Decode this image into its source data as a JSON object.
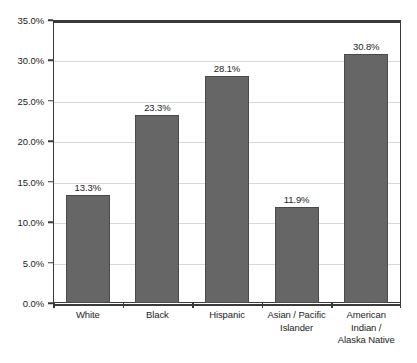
{
  "chart_data": {
    "type": "bar",
    "title": "",
    "subtitle": "",
    "xlabel": "",
    "ylabel": "",
    "categories": [
      "White",
      "Black",
      "Hispanic",
      "Asian / Pacific\nIslander",
      "American\nIndian /\nAlaska Native"
    ],
    "category_lines": [
      [
        "White"
      ],
      [
        "Black"
      ],
      [
        "Hispanic"
      ],
      [
        "Asian / Pacific",
        "Islander"
      ],
      [
        "American",
        "Indian /",
        "Alaska Native"
      ]
    ],
    "values": [
      13.3,
      23.3,
      28.1,
      11.9,
      30.8
    ],
    "value_labels": [
      "13.3%",
      "23.3%",
      "28.1%",
      "11.9%",
      "30.8%"
    ],
    "ylim": [
      0,
      35
    ],
    "ytick_values": [
      0,
      5,
      10,
      15,
      20,
      25,
      30,
      35
    ],
    "ytick_labels": [
      "0.0%",
      "5.0%",
      "10.0%",
      "15.0%",
      "20.0%",
      "25.0%",
      "30.0%",
      "35.0%"
    ],
    "grid": true,
    "legend": null,
    "legend_position": "none",
    "colors": {
      "bar_fill": "#666666",
      "bar_border": "#4a4a4a",
      "gridline": "#d8d8d8",
      "axis": "#3a3a3a",
      "text": "#1d1d1d",
      "background": "#ffffff"
    }
  }
}
